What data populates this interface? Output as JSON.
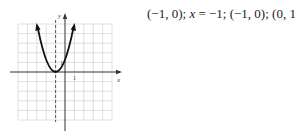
{
  "answer": {
    "vertex": "(−1, 0)",
    "sep1": "; ",
    "axis_var": "x",
    "axis_eq": " = −1",
    "sep2": "; ",
    "x_intercept": "(−1, 0)",
    "sep3": "; ",
    "y_intercept": "(0, 1)"
  },
  "graph": {
    "x_label": "x",
    "y_label": "y",
    "x_tick_label": "1",
    "y_tick_label": "1",
    "function": "y = (x + 1)^2",
    "axis_of_symmetry": "x = -1",
    "grid_range": {
      "x": [
        -5,
        5
      ],
      "y": [
        -5,
        5
      ]
    }
  }
}
